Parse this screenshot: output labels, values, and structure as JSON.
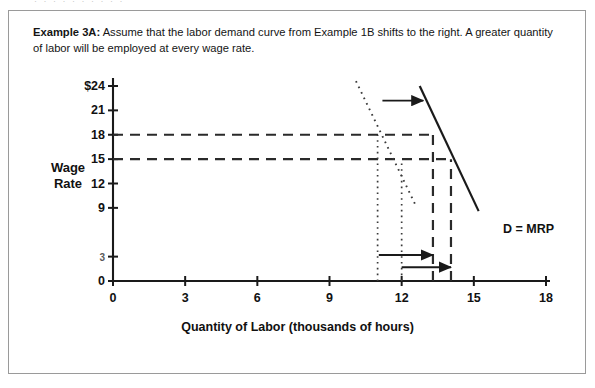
{
  "artifact": {
    "top_sliver_text": "· · · · · · · · · ·"
  },
  "caption": {
    "lead": "Example 3A:",
    "body": " Assume that the labor demand curve from Example 1B shifts to the right. A greater quantity of labor will be employed at every wage rate."
  },
  "chart_data": {
    "type": "line",
    "title": "",
    "xlabel": "Quantity of Labor (thousands of hours)",
    "ylabel": "Wage Rate",
    "ylabel_lines": [
      "Wage",
      "Rate"
    ],
    "xlim": [
      0,
      18
    ],
    "ylim": [
      0,
      24
    ],
    "grid": false,
    "legend_position": "inline-right",
    "x_ticks": [
      "0",
      "3",
      "6",
      "9",
      "12",
      "15",
      "18"
    ],
    "x_tick_values": [
      0,
      3,
      6,
      9,
      12,
      15,
      18
    ],
    "y_ticks": [
      "0",
      "3",
      "9",
      "12",
      "15",
      "18",
      "21",
      "$24"
    ],
    "y_tick_values": [
      0,
      3,
      9,
      12,
      15,
      18,
      21,
      24
    ],
    "y_tick_faded": "3",
    "series": [
      {
        "name": "D = MRP",
        "style": "solid",
        "label": "D = MRP",
        "points": [
          [
            12.75,
            24.0
          ],
          [
            15.2,
            8.6
          ]
        ]
      },
      {
        "name": "original demand (Example 1B)",
        "style": "dotted",
        "label": "",
        "points": [
          [
            10.1,
            24.6
          ],
          [
            12.6,
            9.2
          ]
        ]
      }
    ],
    "annotations": [
      {
        "kind": "h-dashed",
        "y": 18,
        "x_from": 0,
        "x_to": 13.3,
        "label": "wage rate 18"
      },
      {
        "kind": "h-dashed",
        "y": 15,
        "x_from": 0,
        "x_to": 14.05,
        "label": "wage rate 15"
      },
      {
        "kind": "v-dashed",
        "x": 13.3,
        "y_from": 0,
        "y_to": 18,
        "label": "new quantity at 18"
      },
      {
        "kind": "v-dashed",
        "x": 14.05,
        "y_from": 0,
        "y_to": 15,
        "label": "new quantity at 15"
      },
      {
        "kind": "v-dotted",
        "x": 11.0,
        "y_from": 0,
        "y_to": 18,
        "label": "old quantity at 18"
      },
      {
        "kind": "v-dotted",
        "x": 12.0,
        "y_from": 0,
        "y_to": 15,
        "label": "old quantity at 15"
      },
      {
        "kind": "arrow",
        "x_from": 11.2,
        "x_to": 12.9,
        "y": 22.2,
        "label": "curve shift arrow"
      },
      {
        "kind": "arrow",
        "x_from": 11.05,
        "x_to": 13.3,
        "y": 3.2,
        "label": "quantity shift arrow at 18"
      },
      {
        "kind": "arrow",
        "x_from": 12.0,
        "x_to": 14.05,
        "y": 1.7,
        "label": "quantity shift arrow at 15"
      }
    ]
  }
}
